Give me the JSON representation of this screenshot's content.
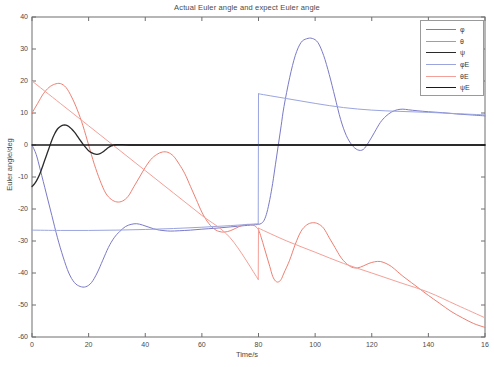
{
  "chart_data": {
    "type": "line",
    "title": "Actual Euler angle and expect Euler angle",
    "xlabel": "Time/s",
    "ylabel": "Euler angle/deg",
    "xlim": [
      0,
      160
    ],
    "ylim": [
      -60,
      40
    ],
    "xticks": [
      0,
      20,
      40,
      60,
      80,
      100,
      120,
      140,
      160
    ],
    "xtick_labels": [
      "0",
      "20",
      "40",
      "60",
      "80",
      "100",
      "120",
      "140",
      "16"
    ],
    "yticks": [
      -60,
      -50,
      -40,
      -30,
      -20,
      -10,
      0,
      10,
      20,
      30,
      40
    ],
    "ytick_labels": [
      "-60",
      "-50",
      "-40",
      "-30",
      "-20",
      "-10",
      "0",
      "10",
      "20",
      "30",
      "40"
    ],
    "grid": false,
    "legend_position": "upper right",
    "series": [
      {
        "name": "φ",
        "color": "#7a7ac8",
        "style": "solid",
        "points": [
          [
            0,
            0
          ],
          [
            1.5,
            -3
          ],
          [
            3,
            -8
          ],
          [
            5,
            -15
          ],
          [
            7,
            -22
          ],
          [
            9,
            -29
          ],
          [
            11,
            -35
          ],
          [
            13,
            -40
          ],
          [
            15,
            -43
          ],
          [
            17,
            -44.2
          ],
          [
            19,
            -44.3
          ],
          [
            21,
            -43
          ],
          [
            23,
            -40
          ],
          [
            25,
            -36
          ],
          [
            27,
            -32
          ],
          [
            29,
            -29
          ],
          [
            31,
            -27
          ],
          [
            33,
            -25.5
          ],
          [
            35,
            -24.8
          ],
          [
            37,
            -24.6
          ],
          [
            39,
            -25
          ],
          [
            41,
            -25.6
          ],
          [
            43,
            -26.2
          ],
          [
            45,
            -26.6
          ],
          [
            47,
            -26.8
          ],
          [
            49,
            -26.9
          ],
          [
            52,
            -26.8
          ],
          [
            56,
            -26.6
          ],
          [
            60,
            -26.3
          ],
          [
            65,
            -26
          ],
          [
            70,
            -25.6
          ],
          [
            75,
            -25.2
          ],
          [
            79,
            -24.9
          ],
          [
            80,
            -24.8
          ],
          [
            81,
            -24.5
          ],
          [
            82,
            -23.5
          ],
          [
            83,
            -21
          ],
          [
            84,
            -17
          ],
          [
            85,
            -12
          ],
          [
            86,
            -6
          ],
          [
            87,
            0
          ],
          [
            88,
            6
          ],
          [
            89,
            12
          ],
          [
            91,
            21
          ],
          [
            93,
            28
          ],
          [
            95,
            32
          ],
          [
            97,
            33.2
          ],
          [
            99,
            33.3
          ],
          [
            101,
            32
          ],
          [
            103,
            28
          ],
          [
            105,
            22
          ],
          [
            107,
            15
          ],
          [
            109,
            8
          ],
          [
            111,
            3
          ],
          [
            113,
            0
          ],
          [
            115,
            -1.5
          ],
          [
            117,
            -1.4
          ],
          [
            119,
            1
          ],
          [
            121,
            4
          ],
          [
            123,
            7
          ],
          [
            125,
            9
          ],
          [
            127,
            10.3
          ],
          [
            129,
            11
          ],
          [
            131,
            11.2
          ],
          [
            133,
            11
          ],
          [
            136,
            10.7
          ],
          [
            140,
            10.4
          ],
          [
            145,
            10.1
          ],
          [
            150,
            9.7
          ],
          [
            155,
            9.4
          ],
          [
            160,
            9.1
          ]
        ]
      },
      {
        "name": "θ",
        "color": "#ee7f72",
        "style": "solid",
        "points": [
          [
            0,
            10
          ],
          [
            2,
            13
          ],
          [
            4,
            16
          ],
          [
            6,
            18
          ],
          [
            8,
            19
          ],
          [
            10,
            19.2
          ],
          [
            12,
            18
          ],
          [
            14,
            15
          ],
          [
            16,
            11
          ],
          [
            18,
            6
          ],
          [
            20,
            0
          ],
          [
            22,
            -6
          ],
          [
            24,
            -11
          ],
          [
            26,
            -15
          ],
          [
            28,
            -17
          ],
          [
            30,
            -17.8
          ],
          [
            32,
            -17.5
          ],
          [
            34,
            -16
          ],
          [
            36,
            -13
          ],
          [
            38,
            -10
          ],
          [
            40,
            -7
          ],
          [
            42,
            -4.5
          ],
          [
            44,
            -3
          ],
          [
            46,
            -2.2
          ],
          [
            48,
            -2.3
          ],
          [
            50,
            -3.5
          ],
          [
            52,
            -6
          ],
          [
            54,
            -9
          ],
          [
            56,
            -13
          ],
          [
            58,
            -17
          ],
          [
            60,
            -21
          ],
          [
            62,
            -24
          ],
          [
            64,
            -26
          ],
          [
            66,
            -27
          ],
          [
            68,
            -27.2
          ],
          [
            70,
            -26.8
          ],
          [
            72,
            -26
          ],
          [
            74,
            -25.2
          ],
          [
            76,
            -24.8
          ],
          [
            78,
            -25
          ],
          [
            79,
            -25.5
          ],
          [
            80,
            -26.5
          ],
          [
            81,
            -29
          ],
          [
            82,
            -32
          ],
          [
            83,
            -35
          ],
          [
            84,
            -38
          ],
          [
            85,
            -41
          ],
          [
            86,
            -42.5
          ],
          [
            87,
            -42.8
          ],
          [
            88,
            -42
          ],
          [
            89,
            -40
          ],
          [
            91,
            -36
          ],
          [
            93,
            -31
          ],
          [
            95,
            -27
          ],
          [
            97,
            -25
          ],
          [
            99,
            -24.3
          ],
          [
            101,
            -24.6
          ],
          [
            103,
            -26
          ],
          [
            105,
            -29
          ],
          [
            107,
            -32
          ],
          [
            109,
            -35
          ],
          [
            111,
            -37
          ],
          [
            113,
            -38.2
          ],
          [
            115,
            -38.4
          ],
          [
            117,
            -37.8
          ],
          [
            119,
            -37
          ],
          [
            121,
            -36.5
          ],
          [
            123,
            -36.4
          ],
          [
            125,
            -37
          ],
          [
            127,
            -38
          ],
          [
            129,
            -39.5
          ],
          [
            131,
            -41
          ],
          [
            134,
            -43
          ],
          [
            137,
            -45
          ],
          [
            140,
            -47
          ],
          [
            144,
            -49.5
          ],
          [
            148,
            -52
          ],
          [
            152,
            -54
          ],
          [
            156,
            -55.8
          ],
          [
            160,
            -57
          ]
        ]
      },
      {
        "name": "ψ",
        "color": "#2a2a2a",
        "style": "solid",
        "points": [
          [
            0,
            -13
          ],
          [
            1,
            -12
          ],
          [
            2,
            -10.5
          ],
          [
            3,
            -8.5
          ],
          [
            4,
            -6
          ],
          [
            5,
            -3.5
          ],
          [
            6,
            -1
          ],
          [
            7,
            1.5
          ],
          [
            8,
            3.5
          ],
          [
            9,
            5
          ],
          [
            10,
            5.8
          ],
          [
            11,
            6.2
          ],
          [
            12,
            6.2
          ],
          [
            13,
            5.8
          ],
          [
            14,
            5
          ],
          [
            15,
            4
          ],
          [
            16,
            2.8
          ],
          [
            17,
            1.5
          ],
          [
            18,
            0.3
          ],
          [
            19,
            -0.8
          ],
          [
            20,
            -1.8
          ],
          [
            21,
            -2.4
          ],
          [
            22,
            -2.8
          ],
          [
            23,
            -2.9
          ],
          [
            24,
            -2.7
          ],
          [
            25,
            -2.2
          ],
          [
            26,
            -1.5
          ],
          [
            27,
            -0.8
          ],
          [
            28,
            -0.3
          ],
          [
            29,
            0
          ],
          [
            30,
            0.1
          ],
          [
            32,
            0.1
          ],
          [
            36,
            0
          ],
          [
            45,
            0
          ],
          [
            60,
            0
          ],
          [
            80,
            0
          ],
          [
            100,
            0
          ],
          [
            130,
            0
          ],
          [
            160,
            0
          ]
        ]
      },
      {
        "name": "φE",
        "color": "#9aa5e0",
        "style": "solid",
        "points": [
          [
            0,
            -26.6
          ],
          [
            10,
            -26.7
          ],
          [
            20,
            -26.7
          ],
          [
            30,
            -26.6
          ],
          [
            40,
            -26.4
          ],
          [
            50,
            -26.1
          ],
          [
            60,
            -25.7
          ],
          [
            70,
            -25.2
          ],
          [
            79.9,
            -24.6
          ],
          [
            80,
            16
          ],
          [
            90,
            14.5
          ],
          [
            100,
            13
          ],
          [
            110,
            11.7
          ],
          [
            120,
            10.9
          ],
          [
            130,
            10.5
          ],
          [
            140,
            10.2
          ],
          [
            150,
            9.8
          ],
          [
            160,
            9.4
          ]
        ]
      },
      {
        "name": "θE",
        "color": "#f4a098",
        "style": "solid",
        "points": [
          [
            0,
            20
          ],
          [
            10,
            13
          ],
          [
            20,
            6
          ],
          [
            30,
            -1
          ],
          [
            40,
            -8
          ],
          [
            50,
            -15
          ],
          [
            60,
            -22
          ],
          [
            70,
            -29
          ],
          [
            79.9,
            -42
          ],
          [
            80,
            -26
          ],
          [
            90,
            -30
          ],
          [
            100,
            -33.5
          ],
          [
            110,
            -37
          ],
          [
            120,
            -40
          ],
          [
            130,
            -43
          ],
          [
            140,
            -46
          ],
          [
            150,
            -50
          ],
          [
            160,
            -54
          ]
        ]
      },
      {
        "name": "ψE",
        "color": "#1a1a1a",
        "style": "solid",
        "points": [
          [
            0,
            0
          ],
          [
            40,
            0
          ],
          [
            80,
            0
          ],
          [
            120,
            0
          ],
          [
            160,
            0
          ]
        ]
      }
    ]
  },
  "legend": {
    "entries": [
      {
        "label": "φ",
        "color": "#7a7ac8"
      },
      {
        "label": "θ",
        "color": "#ee7f72"
      },
      {
        "label": "ψ",
        "color": "#2a2a2a"
      },
      {
        "label": "φE",
        "color": "#9aa5e0"
      },
      {
        "label": "θE",
        "color": "#f4a098"
      },
      {
        "label": "ψE",
        "color": "#1a1a1a"
      }
    ]
  },
  "axes": {
    "frame_color": "#6e6e6e"
  }
}
